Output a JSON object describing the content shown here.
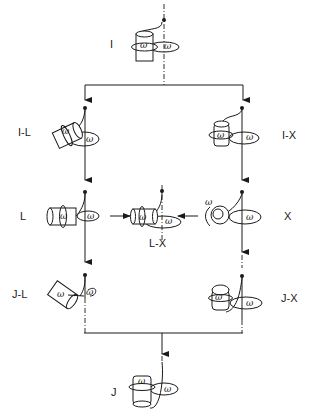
{
  "diagram": {
    "title": "",
    "stages": [
      {
        "id": "I",
        "label": "I"
      },
      {
        "id": "I-L",
        "label": "I-L"
      },
      {
        "id": "I-X",
        "label": "I-X"
      },
      {
        "id": "L",
        "label": "L"
      },
      {
        "id": "L-X",
        "label": "L-X"
      },
      {
        "id": "X",
        "label": "X"
      },
      {
        "id": "J-L",
        "label": "J-L"
      },
      {
        "id": "J-X",
        "label": "J-X"
      },
      {
        "id": "J",
        "label": "J"
      }
    ],
    "omega_symbol": "ω",
    "edges": [
      {
        "from": "I",
        "to": "I-L"
      },
      {
        "from": "I",
        "to": "I-X"
      },
      {
        "from": "I-L",
        "to": "L"
      },
      {
        "from": "I-X",
        "to": "X"
      },
      {
        "from": "L",
        "to": "J-L"
      },
      {
        "from": "X",
        "to": "J-X"
      },
      {
        "from": "L",
        "to": "L-X"
      },
      {
        "from": "X",
        "to": "L-X"
      },
      {
        "from": "J-L",
        "to": "J"
      },
      {
        "from": "J-X",
        "to": "J"
      }
    ],
    "colors": {
      "ink": "#1a1a1a",
      "background": "#ffffff"
    }
  }
}
